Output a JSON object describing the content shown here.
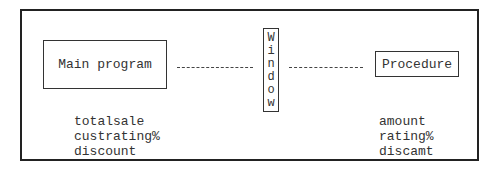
{
  "diagram": {
    "main_box": {
      "label": "Main program",
      "variables": [
        "totalsale",
        "custrating%",
        "discount"
      ]
    },
    "window_box": {
      "label": "Window",
      "letters": [
        "W",
        "i",
        "n",
        "d",
        "o",
        "w"
      ]
    },
    "procedure_box": {
      "label": "Procedure",
      "variables": [
        "amount",
        "rating%",
        "discamt"
      ]
    }
  }
}
